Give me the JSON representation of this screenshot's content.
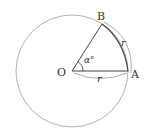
{
  "diagram": {
    "type": "geometry-circle-sector",
    "points": {
      "center": {
        "label": "O",
        "x": 72,
        "y": 71
      },
      "a": {
        "label": "A",
        "x": 128,
        "y": 71
      },
      "b": {
        "label": "B",
        "x": 103,
        "y": 25
      }
    },
    "angle_label": "α°",
    "radius_label": "r",
    "arc_label": "r",
    "colors": {
      "circle": "#aaaaaa",
      "lines": "#444444",
      "labels": "#333333"
    }
  }
}
